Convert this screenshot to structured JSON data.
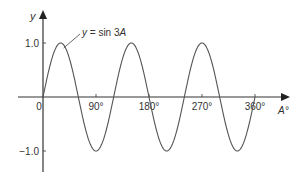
{
  "chart_data": {
    "type": "line",
    "title": "",
    "function": "sin 3A",
    "annotation": {
      "prefix": "y",
      "equals": " = sin 3",
      "var": "A",
      "points_to_deg": 30
    },
    "xlabel": "A°",
    "ylabel": "y",
    "xlim": [
      0,
      360
    ],
    "ylim": [
      -1.0,
      1.0
    ],
    "x_ticks": [
      {
        "value": 0,
        "label": "0"
      },
      {
        "value": 90,
        "label": "90°"
      },
      {
        "value": 180,
        "label": "180°"
      },
      {
        "value": 270,
        "label": "270°"
      },
      {
        "value": 360,
        "label": "360°"
      }
    ],
    "y_ticks": [
      {
        "value": 1.0,
        "label": "1.0"
      },
      {
        "value": -1.0,
        "label": "−1.0"
      }
    ],
    "series": [
      {
        "name": "y = sin 3A",
        "amplitude": 1.0,
        "frequency": 3,
        "x_start": 0,
        "x_end": 360,
        "color": "#555555"
      }
    ],
    "grid": false,
    "legend": "none"
  }
}
